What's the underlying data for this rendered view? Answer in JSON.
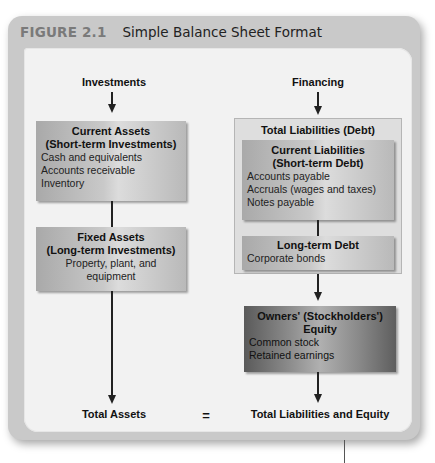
{
  "figure": {
    "number": "FIGURE 2.1",
    "title": "Simple Balance Sheet Format"
  },
  "left": {
    "heading": "Investments",
    "current_assets": {
      "title_line1": "Current Assets",
      "title_line2": "(Short-term Investments)",
      "items": [
        "Cash and equivalents",
        "Accounts receivable",
        "Inventory"
      ]
    },
    "fixed_assets": {
      "title_line1": "Fixed Assets",
      "title_line2": "(Long-term Investments)",
      "items": [
        "Property, plant, and equipment"
      ]
    },
    "total": "Total Assets"
  },
  "equals": "=",
  "right": {
    "heading": "Financing",
    "total_liabilities": "Total Liabilities (Debt)",
    "current_liabilities": {
      "title_line1": "Current Liabilities",
      "title_line2": "(Short-term Debt)",
      "items": [
        "Accounts payable",
        "Accruals (wages and taxes)",
        "Notes payable"
      ]
    },
    "long_term_debt": {
      "title": "Long-term Debt",
      "items": [
        "Corporate bonds"
      ]
    },
    "equity": {
      "title_line1": "Owners' (Stockholders')",
      "title_line2": "Equity",
      "items": [
        "Common stock",
        "Retained earnings"
      ]
    },
    "total": "Total Liabilities and Equity"
  }
}
